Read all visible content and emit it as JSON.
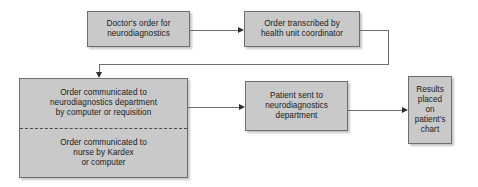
{
  "diagram": {
    "type": "flowchart",
    "colors": {
      "node_fill": "#c9c9c9",
      "node_border": "#6e6e6e",
      "connector": "#6e6e6e",
      "arrowhead": "#2f2f2f",
      "background": "#ffffff",
      "divider": "#4a4a4a"
    },
    "nodes": [
      {
        "id": "doctors-order",
        "lines": [
          "Doctor's order for",
          "neurodiagnostics"
        ]
      },
      {
        "id": "order-transcribed",
        "lines": [
          "Order transcribed by",
          "health unit coordinator"
        ]
      },
      {
        "id": "order-communicated",
        "upper_lines": [
          "Order communicated to",
          "neurodiagnostics department",
          "by computer or requisition"
        ],
        "lower_lines": [
          "Order communicated to",
          "nurse by Kardex",
          "or computer"
        ]
      },
      {
        "id": "patient-sent",
        "lines": [
          "Patient sent to",
          "neurodiagnostics",
          "department"
        ]
      },
      {
        "id": "results-placed",
        "lines": [
          "Results",
          "placed",
          "on",
          "patient's",
          "chart"
        ]
      }
    ],
    "edges": [
      {
        "id": "doctors-order-to-order-transcribed",
        "style": "straight-right"
      },
      {
        "id": "order-transcribed-to-order-communicated",
        "style": "elbow-down-left"
      },
      {
        "id": "order-communicated-to-patient-sent",
        "style": "straight-right"
      },
      {
        "id": "patient-sent-to-results-placed",
        "style": "straight-right"
      }
    ]
  }
}
